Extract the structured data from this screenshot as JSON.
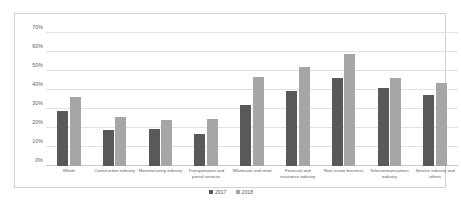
{
  "chart_data": {
    "type": "bar",
    "title": "",
    "subtitle": "",
    "xlabel": "",
    "ylabel": "",
    "ylim": [
      0,
      70
    ],
    "ytick_labels": [
      "70%",
      "60%",
      "50%",
      "40%",
      "30%",
      "20%",
      "10%",
      "0%"
    ],
    "ytick_values": [
      70,
      60,
      50,
      40,
      30,
      20,
      10,
      0
    ],
    "grid": true,
    "legend_position": "bottom",
    "categories": [
      "Whole",
      "Construction industry",
      "Manufacturing industry",
      "Transportation and postal services",
      "Wholesale and retail",
      "Financial and insurance industry",
      "Real estate business",
      "Telecommunications industry",
      "Service industry and others"
    ],
    "series": [
      {
        "name": "2017",
        "color": "#595959",
        "values": [
          29,
          19,
          19.5,
          17,
          32,
          39.5,
          46.5,
          41,
          37.5
        ]
      },
      {
        "name": "2018",
        "color": "#a6a6a6",
        "values": [
          36.5,
          26,
          24,
          24.5,
          47,
          52,
          59,
          46.5,
          43.5
        ]
      }
    ]
  },
  "legend": {
    "items": [
      {
        "label": "2017"
      },
      {
        "label": "2018"
      }
    ]
  }
}
